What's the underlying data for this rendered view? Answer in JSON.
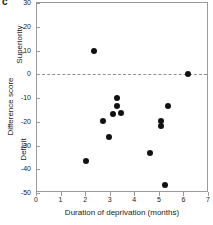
{
  "panel": {
    "label": "c"
  },
  "chart_data": {
    "type": "scatter",
    "title": "",
    "xlabel": "Duration of deprivation (months)",
    "ylabel": "Difference score",
    "xlim": [
      0,
      7
    ],
    "ylim": [
      -50,
      30
    ],
    "xticks": [
      0,
      1,
      2,
      3,
      4,
      5,
      6,
      7
    ],
    "xticklabels": [
      "0",
      "1",
      "2",
      "3",
      "4",
      "5",
      "6",
      "7"
    ],
    "yticks": [
      30,
      20,
      10,
      0,
      -10,
      -20,
      -30,
      -40,
      -50
    ],
    "yticklabels": [
      "30",
      "20",
      "10",
      "0",
      "-10",
      "-20",
      "-30",
      "-40",
      "-50"
    ],
    "grid": false,
    "legend": null,
    "annotations": [
      {
        "text": "Superiority",
        "position": "y-axis-upper",
        "meaning": "difference score above zero"
      },
      {
        "text": "Deficit",
        "position": "y-axis-lower",
        "meaning": "difference score below zero"
      }
    ],
    "reference_lines": [
      {
        "axis": "y",
        "value": 0,
        "style": "dashed",
        "color": "#909090"
      }
    ],
    "marker": {
      "shape": "circle",
      "filled": true,
      "color": "#111111",
      "size": 6
    },
    "points": [
      {
        "x": 2.3,
        "y": 10.0
      },
      {
        "x": 6.15,
        "y": 0.2
      },
      {
        "x": 3.25,
        "y": -10.2
      },
      {
        "x": 5.35,
        "y": -13.3
      },
      {
        "x": 3.25,
        "y": -13.5
      },
      {
        "x": 3.1,
        "y": -16.8
      },
      {
        "x": 3.4,
        "y": -16.5
      },
      {
        "x": 5.05,
        "y": -19.5
      },
      {
        "x": 2.7,
        "y": -19.7
      },
      {
        "x": 5.05,
        "y": -21.8
      },
      {
        "x": 2.93,
        "y": -26.6
      },
      {
        "x": 4.6,
        "y": -33.3
      },
      {
        "x": 2.0,
        "y": -36.7
      },
      {
        "x": 5.22,
        "y": -46.7
      }
    ]
  }
}
